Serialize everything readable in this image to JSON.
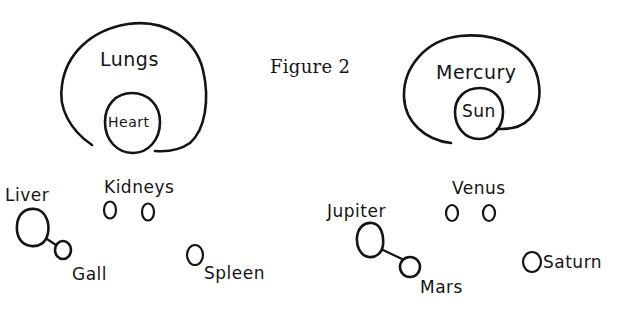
{
  "figure": {
    "title": "Figure 2",
    "ink_color": "#141414",
    "background": "#ffffff"
  },
  "anatomy_group": {
    "organs": {
      "lungs": {
        "label": "Lungs"
      },
      "heart": {
        "label": "Heart"
      },
      "liver": {
        "label": "Liver"
      },
      "gall": {
        "label": "Gall"
      },
      "kidneys": {
        "label": "Kidneys"
      },
      "spleen": {
        "label": "Spleen"
      }
    }
  },
  "planet_group": {
    "bodies": {
      "mercury": {
        "label": "Mercury"
      },
      "sun": {
        "label": "Sun"
      },
      "jupiter": {
        "label": "Jupiter"
      },
      "mars": {
        "label": "Mars"
      },
      "venus": {
        "label": "Venus"
      },
      "saturn": {
        "label": "Saturn"
      }
    }
  }
}
